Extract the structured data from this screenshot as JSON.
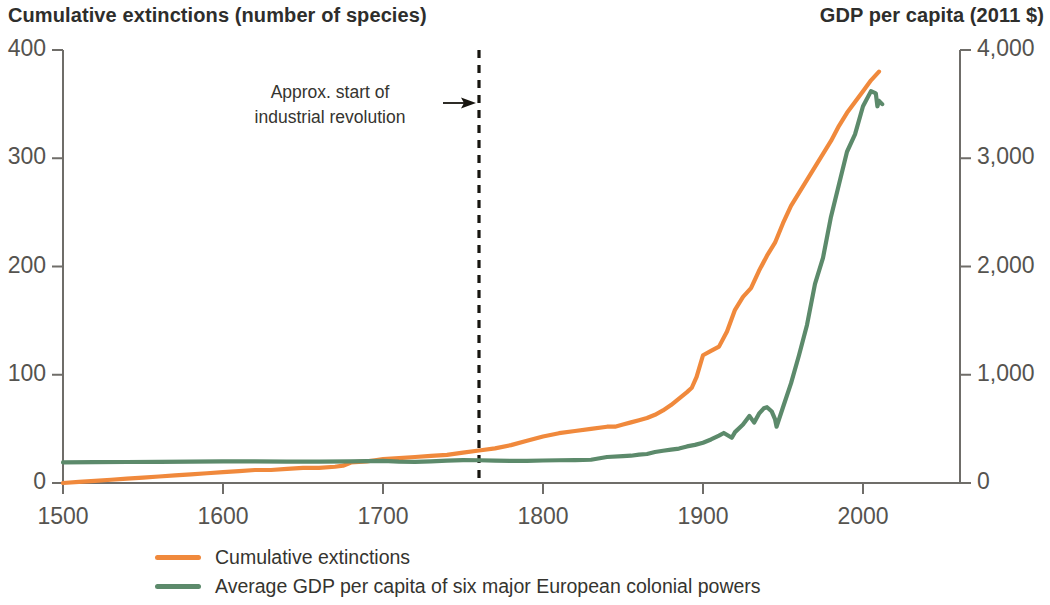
{
  "left_axis_title": "Cumulative extinctions (number of species)",
  "right_axis_title": "GDP per capita (2011 $)",
  "annotation": {
    "line1": "Approx. start of",
    "line2": "industrial revolution",
    "marker_year": 1760
  },
  "legend": {
    "items": [
      {
        "label": "Cumulative extinctions",
        "color": "#F0893C"
      },
      {
        "label": "Average GDP per capita of six major European colonial powers",
        "color": "#5C8A6B"
      }
    ]
  },
  "chart_data": {
    "type": "line",
    "title": "",
    "xlabel": "",
    "ylabel": "Cumulative extinctions (number of species)",
    "y2label": "GDP per capita (2011 $)",
    "xlim": [
      1500,
      2012
    ],
    "ylim": [
      0,
      400
    ],
    "y2lim": [
      0,
      4000
    ],
    "xticks": [
      1500,
      1600,
      1700,
      1800,
      1900,
      2000
    ],
    "xtick_labels": [
      "1500",
      "1600",
      "1700",
      "1800",
      "1900",
      "2000"
    ],
    "yticks": [
      0,
      100,
      200,
      300,
      400
    ],
    "ytick_labels": [
      "0",
      "100",
      "200",
      "300",
      "400"
    ],
    "y2ticks": [
      0,
      1000,
      2000,
      3000,
      4000
    ],
    "y2tick_labels": [
      "0",
      "1,000",
      "2,000",
      "3,000",
      "4,000"
    ],
    "grid": false,
    "legend_position": "below",
    "annotations": [
      {
        "text": "Approx. start of industrial revolution",
        "x": 1760,
        "type": "vline-dashed-with-arrow"
      }
    ],
    "series": [
      {
        "name": "Cumulative extinctions",
        "color": "#F0893C",
        "axis": "left",
        "units": "number of species",
        "x": [
          1500,
          1510,
          1520,
          1530,
          1540,
          1550,
          1560,
          1570,
          1580,
          1590,
          1600,
          1610,
          1620,
          1630,
          1640,
          1650,
          1660,
          1670,
          1675,
          1680,
          1690,
          1695,
          1700,
          1710,
          1720,
          1730,
          1740,
          1750,
          1760,
          1770,
          1780,
          1790,
          1800,
          1810,
          1820,
          1830,
          1840,
          1845,
          1850,
          1855,
          1860,
          1865,
          1870,
          1875,
          1880,
          1885,
          1890,
          1893,
          1896,
          1900,
          1905,
          1910,
          1915,
          1920,
          1925,
          1930,
          1935,
          1940,
          1945,
          1950,
          1955,
          1960,
          1965,
          1970,
          1975,
          1980,
          1985,
          1990,
          1995,
          2000,
          2005,
          2010
        ],
        "y": [
          0,
          1,
          2,
          3,
          4,
          5,
          6,
          7,
          8,
          9,
          10,
          11,
          12,
          12,
          13,
          14,
          14,
          15,
          16,
          19,
          20,
          21,
          22,
          23,
          24,
          25,
          26,
          28,
          30,
          32,
          35,
          39,
          43,
          46,
          48,
          50,
          52,
          52,
          54,
          56,
          58,
          60,
          63,
          67,
          72,
          78,
          84,
          88,
          98,
          118,
          122,
          126,
          140,
          160,
          172,
          180,
          196,
          210,
          222,
          240,
          256,
          268,
          280,
          292,
          304,
          316,
          330,
          342,
          352,
          362,
          372,
          380
        ]
      },
      {
        "name": "Average GDP per capita of six major European colonial powers",
        "color": "#5C8A6B",
        "axis": "right",
        "units": "2011 $",
        "x": [
          1500,
          1520,
          1540,
          1560,
          1580,
          1600,
          1620,
          1640,
          1660,
          1680,
          1700,
          1710,
          1720,
          1730,
          1740,
          1750,
          1760,
          1770,
          1780,
          1790,
          1800,
          1810,
          1820,
          1830,
          1840,
          1850,
          1855,
          1860,
          1865,
          1870,
          1875,
          1880,
          1885,
          1890,
          1895,
          1900,
          1905,
          1910,
          1913,
          1918,
          1920,
          1925,
          1929,
          1932,
          1935,
          1938,
          1940,
          1943,
          1945,
          1946,
          1950,
          1955,
          1960,
          1965,
          1970,
          1975,
          1980,
          1985,
          1990,
          1995,
          2000,
          2005,
          2008,
          2009,
          2010,
          2012
        ],
        "y": [
          190,
          192,
          194,
          196,
          198,
          200,
          200,
          198,
          198,
          200,
          205,
          198,
          196,
          200,
          206,
          212,
          210,
          206,
          204,
          205,
          208,
          210,
          212,
          215,
          240,
          248,
          252,
          262,
          268,
          286,
          298,
          308,
          318,
          338,
          352,
          372,
          402,
          438,
          462,
          418,
          470,
          540,
          620,
          558,
          640,
          690,
          700,
          660,
          590,
          520,
          700,
          920,
          1180,
          1460,
          1840,
          2080,
          2460,
          2760,
          3060,
          3220,
          3480,
          3620,
          3600,
          3480,
          3530,
          3500
        ]
      }
    ]
  }
}
